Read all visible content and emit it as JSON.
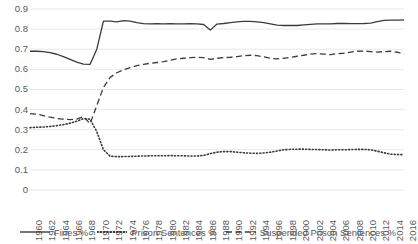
{
  "chart_data": {
    "type": "line",
    "title": "",
    "xlabel": "",
    "ylabel": "",
    "xlim": [
      1960,
      2016
    ],
    "ylim": [
      0,
      0.9
    ],
    "grid": true,
    "legend_position": "bottom",
    "y_ticks": [
      "0.9",
      "0.8",
      "0.7",
      "0.6",
      "0.5",
      "0.4",
      "0.3",
      "0.2",
      "0.1",
      "0"
    ],
    "y_tick_values": [
      0.9,
      0.8,
      0.7,
      0.6,
      0.5,
      0.4,
      0.3,
      0.2,
      0.1,
      0
    ],
    "x_tick_labels": [
      "1960",
      "1962",
      "1964",
      "1966",
      "1968",
      "1970",
      "1972",
      "1974",
      "1976",
      "1978",
      "1980",
      "1982",
      "1984",
      "1986",
      "1988",
      "1990",
      "1992",
      "1994",
      "1996",
      "1998",
      "2000",
      "2002",
      "2004",
      "2006",
      "2008",
      "2010",
      "2012",
      "2014",
      "2016"
    ],
    "x": [
      1960,
      1961,
      1962,
      1963,
      1964,
      1965,
      1966,
      1967,
      1968,
      1969,
      1970,
      1971,
      1972,
      1973,
      1974,
      1975,
      1976,
      1977,
      1978,
      1979,
      1980,
      1981,
      1982,
      1983,
      1984,
      1985,
      1986,
      1987,
      1988,
      1989,
      1990,
      1991,
      1992,
      1993,
      1994,
      1995,
      1996,
      1997,
      1998,
      1999,
      2000,
      2001,
      2002,
      2003,
      2004,
      2005,
      2006,
      2007,
      2008,
      2009,
      2010,
      2011,
      2012,
      2013,
      2014,
      2015,
      2016
    ],
    "series": [
      {
        "name": "Fines %",
        "style": "solid",
        "color": "#3b3b3b",
        "values": [
          0.69,
          0.69,
          0.688,
          0.683,
          0.675,
          0.663,
          0.65,
          0.636,
          0.626,
          0.625,
          0.7,
          0.84,
          0.84,
          0.836,
          0.842,
          0.84,
          0.832,
          0.827,
          0.826,
          0.827,
          0.826,
          0.827,
          0.826,
          0.826,
          0.827,
          0.826,
          0.823,
          0.795,
          0.825,
          0.828,
          0.832,
          0.836,
          0.838,
          0.838,
          0.836,
          0.832,
          0.826,
          0.82,
          0.818,
          0.818,
          0.818,
          0.821,
          0.824,
          0.826,
          0.826,
          0.826,
          0.828,
          0.828,
          0.827,
          0.827,
          0.828,
          0.83,
          0.837,
          0.843,
          0.845,
          0.845,
          0.846
        ]
      },
      {
        "name": "Prison Sentences %",
        "style": "dotted",
        "color": "#3b3b3b",
        "values": [
          0.31,
          0.312,
          0.313,
          0.316,
          0.32,
          0.325,
          0.332,
          0.342,
          0.355,
          0.352,
          0.29,
          0.2,
          0.168,
          0.166,
          0.166,
          0.167,
          0.168,
          0.169,
          0.17,
          0.17,
          0.17,
          0.171,
          0.17,
          0.17,
          0.169,
          0.169,
          0.172,
          0.181,
          0.188,
          0.191,
          0.191,
          0.188,
          0.185,
          0.183,
          0.182,
          0.184,
          0.188,
          0.194,
          0.2,
          0.202,
          0.203,
          0.203,
          0.202,
          0.201,
          0.2,
          0.199,
          0.2,
          0.2,
          0.201,
          0.202,
          0.202,
          0.2,
          0.193,
          0.185,
          0.178,
          0.176,
          0.176
        ]
      },
      {
        "name": "Suspended Prison Sentences %",
        "style": "dashed",
        "color": "#3b3b3b",
        "values": [
          0.38,
          0.377,
          0.37,
          0.362,
          0.356,
          0.352,
          0.35,
          0.352,
          0.365,
          0.33,
          0.42,
          0.51,
          0.56,
          0.583,
          0.598,
          0.608,
          0.618,
          0.625,
          0.63,
          0.634,
          0.638,
          0.645,
          0.652,
          0.655,
          0.658,
          0.66,
          0.658,
          0.65,
          0.655,
          0.658,
          0.66,
          0.663,
          0.668,
          0.67,
          0.668,
          0.662,
          0.655,
          0.652,
          0.655,
          0.66,
          0.665,
          0.67,
          0.676,
          0.678,
          0.676,
          0.673,
          0.678,
          0.68,
          0.686,
          0.69,
          0.691,
          0.688,
          0.686,
          0.688,
          0.69,
          0.685,
          0.676
        ]
      }
    ]
  },
  "legend": {
    "items": [
      {
        "label": "Fines %",
        "style": "solid"
      },
      {
        "label": "Prison Sentences %",
        "style": "dotted"
      },
      {
        "label": "Suspended Prison Sentences %",
        "style": "dashed"
      }
    ]
  }
}
